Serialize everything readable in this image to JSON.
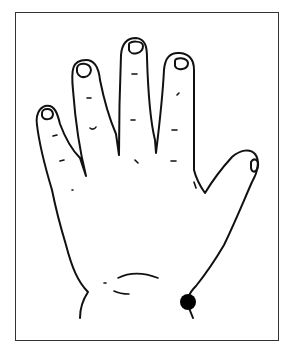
{
  "figure": {
    "stroke_color": "#111111",
    "marker_color": "#000000",
    "border_color": "#333333",
    "marker": {
      "cx": 188,
      "cy": 302,
      "r": 8,
      "label": "acupoint-marker"
    }
  }
}
